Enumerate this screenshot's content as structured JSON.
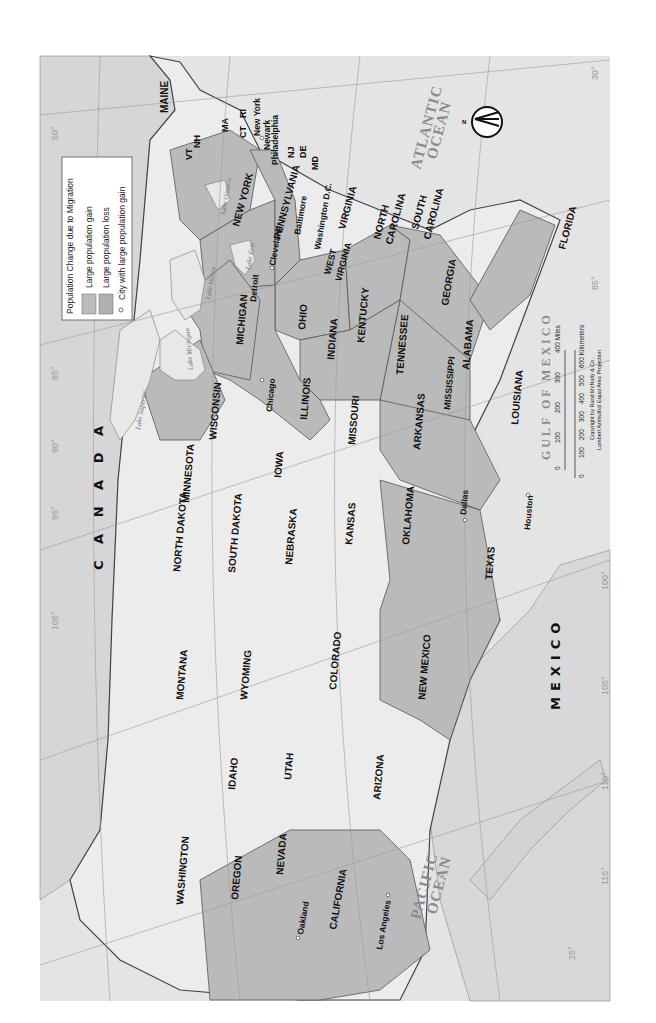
{
  "map": {
    "orientation": "rotated 90 degrees counter-clockwise (north points left)",
    "colors": {
      "paper": "#ffffff",
      "water": "#e6e6e6",
      "land_outside": "#d9d9d9",
      "state_neutral": "#ececec",
      "state_shaded": "#b9b9b9",
      "border": "#555555",
      "graticule": "#9a9a9a",
      "text": "#111111"
    }
  },
  "legend": {
    "title": "Population Change due to Migration",
    "items": [
      {
        "label": "Large population gain",
        "swatch": "#bcbcbc"
      },
      {
        "label": "Large population loss",
        "swatch": "#b0b0b0"
      },
      {
        "label": "City with large population gain",
        "symbol": "open-circle"
      }
    ]
  },
  "countries": {
    "canada": "C A N A D A",
    "mexico": "MEXICO"
  },
  "water_bodies": {
    "atlantic": [
      "ATLANTIC",
      "OCEAN"
    ],
    "pacific": [
      "PACIFIC",
      "OCEAN"
    ],
    "gulf": "GULF OF MEXICO",
    "lakes": [
      "Lake Superior",
      "Lake Michigan",
      "Lake Huron",
      "Lake Erie",
      "Lake Ontario"
    ]
  },
  "states": {
    "maine": "MAINE",
    "nh": "NH",
    "vt": "VT",
    "ma": "MA",
    "ct": "CT",
    "ri": "RI",
    "new_york": "NEW YORK",
    "nj": "NJ",
    "de": "DE",
    "md": "MD",
    "pennsylvania": "PENNSYLVANIA",
    "virginia": "VIRGINIA",
    "west_virginia": [
      "WEST",
      "VIRGINIA"
    ],
    "north_carolina": [
      "NORTH",
      "CAROLINA"
    ],
    "south_carolina": [
      "SOUTH",
      "CAROLINA"
    ],
    "georgia": "GEORGIA",
    "florida": "FLORIDA",
    "ohio": "OHIO",
    "michigan": "MICHIGAN",
    "indiana": "INDIANA",
    "kentucky": "KENTUCKY",
    "tennessee": "TENNESSEE",
    "alabama": "ALABAMA",
    "mississippi": "MISSISSIPPI",
    "wisconsin": "WISCONSIN",
    "illinois": "ILLINOIS",
    "louisiana": "LOUISIANA",
    "arkansas": "ARKANSAS",
    "missouri": "MISSOURI",
    "iowa": "IOWA",
    "minnesota": "MINNESOTA",
    "north_dakota": "NORTH DAKOTA",
    "south_dakota": "SOUTH DAKOTA",
    "nebraska": "NEBRASKA",
    "kansas": "KANSAS",
    "oklahoma": "OKLAHOMA",
    "texas": "TEXAS",
    "montana": "MONTANA",
    "wyoming": "WYOMING",
    "colorado": "COLORADO",
    "new_mexico": "NEW MEXICO",
    "idaho": "IDAHO",
    "utah": "UTAH",
    "arizona": "ARIZONA",
    "washington": "WASHINGTON",
    "oregon": "OREGON",
    "nevada": "NEVADA",
    "california": "CALIFORNIA"
  },
  "cities": [
    "New York",
    "Newark",
    "Philadelphia",
    "Baltimore",
    "Washington D.C.",
    "Cleveland",
    "Detroit",
    "Chicago",
    "Dallas",
    "Houston",
    "Los Angeles",
    "Oakland"
  ],
  "graticule": {
    "latitudes": [
      "50°",
      "45°",
      "40°",
      "35°",
      "30°",
      "25°"
    ],
    "longitudes": [
      "70°",
      "75°",
      "80°",
      "85°",
      "90°",
      "95°",
      "100°",
      "105°",
      "110°",
      "115°",
      "120°",
      "125°"
    ]
  },
  "scale": {
    "miles_ticks": [
      "0",
      "100",
      "200",
      "300",
      "400 Miles"
    ],
    "km_ticks": [
      "0",
      "100",
      "200",
      "300",
      "400",
      "500",
      "600 Kilometers"
    ],
    "copyright": "Copyright by Rand McNally & Co.",
    "projection": "Lambert Azimuthal Equal Area Projection"
  },
  "compass": {
    "label": "N"
  }
}
